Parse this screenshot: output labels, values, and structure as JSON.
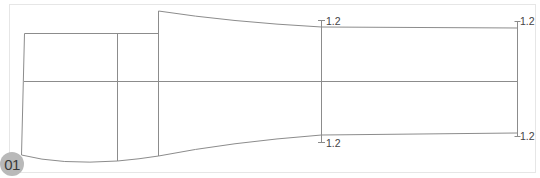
{
  "figure": {
    "badge": "01",
    "annotations": {
      "mid_top": "1.2",
      "mid_bottom": "1.2",
      "right_top": "1.2",
      "right_bottom": "1.2"
    },
    "colors": {
      "line": "#8c8c8c",
      "frame": "#e6e6e6",
      "badge_bg": "#b9b9b9",
      "badge_text": "#3a3a3a"
    }
  }
}
